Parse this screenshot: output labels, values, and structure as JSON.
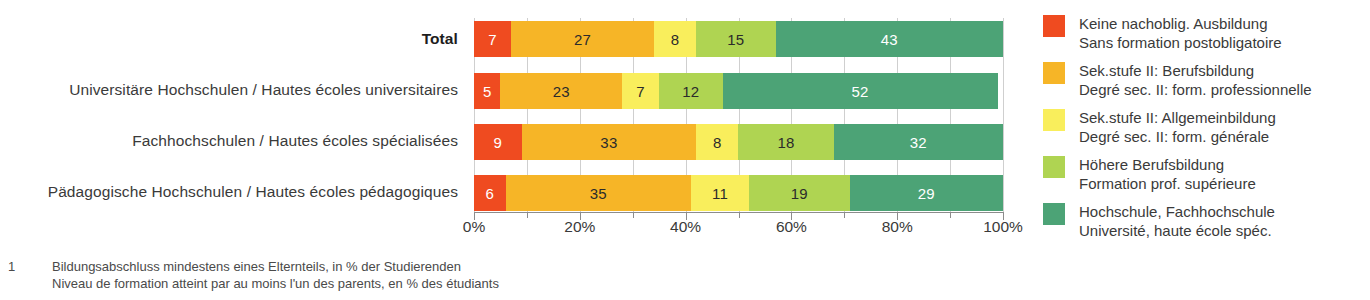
{
  "chart_data": {
    "type": "bar",
    "orientation": "horizontal",
    "stacked": true,
    "normalized_percent": true,
    "title": "",
    "subtitle": "",
    "xlabel": "",
    "ylabel": "",
    "xlim": [
      0,
      100
    ],
    "grid": true,
    "legend_position": "right",
    "categories": [
      "Total",
      "Universitäre Hochschulen / Hautes écoles universitaires",
      "Fachhochschulen / Hautes écoles spécialisées",
      "Pädagogische Hochschulen / Hautes écoles pédagogiques"
    ],
    "category_is_total": [
      true,
      false,
      false,
      false
    ],
    "series": [
      {
        "name": "Keine nachoblig. Ausbildung",
        "name_fr": "Sans formation postobligatoire",
        "color": "#EF4B20",
        "values": [
          7,
          5,
          9,
          6
        ],
        "label_color": "light"
      },
      {
        "name": "Sek.stufe II: Berufsbildung",
        "name_fr": "Degré sec. II: form. professionnelle",
        "color": "#F6B527",
        "values": [
          27,
          23,
          33,
          35
        ],
        "label_color": "dark"
      },
      {
        "name": "Sek.stufe II: Allgemeinbildung",
        "name_fr": "Degré sec. II: form. générale",
        "color": "#F9EE5C",
        "values": [
          8,
          7,
          8,
          11
        ],
        "label_color": "dark"
      },
      {
        "name": "Höhere Berufsbildung",
        "name_fr": "Formation prof. supérieure",
        "color": "#AFD452",
        "values": [
          15,
          12,
          18,
          19
        ],
        "label_color": "dark"
      },
      {
        "name": "Hochschule, Fachhochschule",
        "name_fr": "Université, haute école spéc.",
        "color": "#4CA376",
        "values": [
          43,
          52,
          32,
          29
        ],
        "label_color": "light"
      }
    ],
    "xticks": [
      0,
      20,
      40,
      60,
      80,
      100
    ],
    "xticklabels": [
      "0%",
      "20%",
      "40%",
      "60%",
      "80%",
      "100%"
    ],
    "minor_xticks": [
      10,
      30,
      50,
      70,
      90
    ],
    "gridline_positions": [
      0,
      10,
      20,
      30,
      40,
      50,
      60,
      70,
      80,
      90,
      100
    ],
    "axis_color": "#8c8c8c",
    "gridline_color": "#cfcfcf"
  },
  "legend": {
    "items": [
      {
        "color": "#EF4B20",
        "line1": "Keine nachoblig. Ausbildung",
        "line2": "Sans formation postobligatoire"
      },
      {
        "color": "#F6B527",
        "line1": "Sek.stufe II: Berufsbildung",
        "line2": "Degré sec. II: form. professionnelle"
      },
      {
        "color": "#F9EE5C",
        "line1": "Sek.stufe II: Allgemeinbildung",
        "line2": "Degré sec. II: form. générale"
      },
      {
        "color": "#AFD452",
        "line1": "Höhere Berufsbildung",
        "line2": "Formation prof. supérieure"
      },
      {
        "color": "#4CA376",
        "line1": "Hochschule, Fachhochschule",
        "line2": "Université, haute école spéc."
      }
    ]
  },
  "footnote": {
    "marker": "1",
    "line1": "Bildungsabschluss mindestens eines Elternteils, in % der Studierenden",
    "line2": "Niveau de formation atteint par au moins l'un des parents, en % des étudiants"
  }
}
